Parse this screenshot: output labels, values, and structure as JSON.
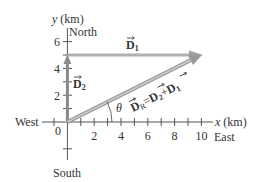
{
  "diagram": {
    "type": "vector-addition",
    "axes": {
      "x_label_var": "x",
      "x_label_unit": "(km)",
      "y_label_var": "y",
      "y_label_unit": "(km)",
      "x_ticks": [
        "2",
        "4",
        "6",
        "8",
        "10"
      ],
      "y_ticks": [
        "2",
        "4",
        "6"
      ],
      "origin_label": "0"
    },
    "directions": {
      "north": "North",
      "south": "South",
      "east": "East",
      "west": "West"
    },
    "vectors": {
      "d1": {
        "symbol": "D",
        "subscript": "1",
        "from": [
          0,
          5
        ],
        "to": [
          10,
          5
        ]
      },
      "d2": {
        "symbol": "D",
        "subscript": "2",
        "from": [
          0,
          0
        ],
        "to": [
          0,
          5
        ]
      },
      "dr": {
        "symbol": "D",
        "subscript": "R",
        "equation_eq": "=",
        "equation_plus": "+",
        "eq_term1": "D",
        "eq_term1_sub": "2",
        "eq_term2": "D",
        "eq_term2_sub": "1",
        "from": [
          0,
          0
        ],
        "to": [
          10,
          5
        ]
      }
    },
    "angle_label": "θ",
    "colors": {
      "vector": "#a8a8a8",
      "vector_outline": "#7a7a7a",
      "axis": "#555555",
      "text": "#333333"
    }
  }
}
